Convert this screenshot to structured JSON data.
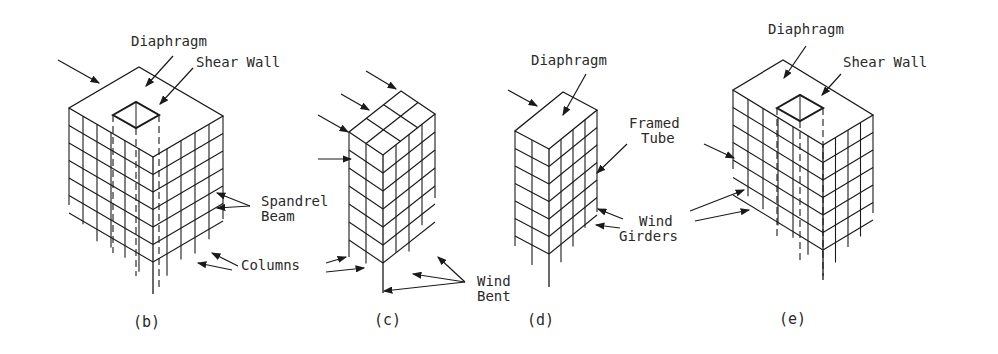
{
  "figure": {
    "panels": [
      {
        "id": "b",
        "caption": "(b)",
        "system": "shear-wall-frame",
        "labels": {
          "diaphragm": "Diaphragm",
          "shear_wall": "Shear Wall",
          "spandrel": "Spandrel\nBeam",
          "columns": "Columns"
        }
      },
      {
        "id": "c",
        "caption": "(c)",
        "system": "wind-bent",
        "labels": {
          "wind_bent": "Wind\nBent"
        }
      },
      {
        "id": "d",
        "caption": "(d)",
        "system": "framed-tube",
        "labels": {
          "diaphragm": "Diaphragm",
          "framed_tube": "Framed\nTube",
          "wind_girders": "Wind\nGirders"
        }
      },
      {
        "id": "e",
        "caption": "(e)",
        "system": "tube-with-core",
        "labels": {
          "diaphragm": "Diaphragm",
          "shear_wall": "Shear Wall"
        }
      }
    ]
  },
  "labels": {
    "b_diaphragm": "Diaphragm",
    "b_shear_wall": "Shear Wall",
    "b_spandrel_1": "Spandrel",
    "b_spandrel_2": "Beam",
    "b_columns": "Columns",
    "c_wind_1": "Wind",
    "c_wind_2": "Bent",
    "d_diaphragm": "Diaphragm",
    "d_framed_1": "Framed",
    "d_framed_2": "Tube",
    "d_girders_1": "Wind",
    "d_girders_2": "Girders",
    "e_diaphragm": "Diaphragm",
    "e_shear_wall": "Shear Wall"
  },
  "captions": {
    "b": "(b)",
    "c": "(c)",
    "d": "(d)",
    "e": "(e)"
  },
  "colors": {
    "ink": "#1a1a1a",
    "text": "#2a2a2a",
    "background": "#ffffff"
  }
}
